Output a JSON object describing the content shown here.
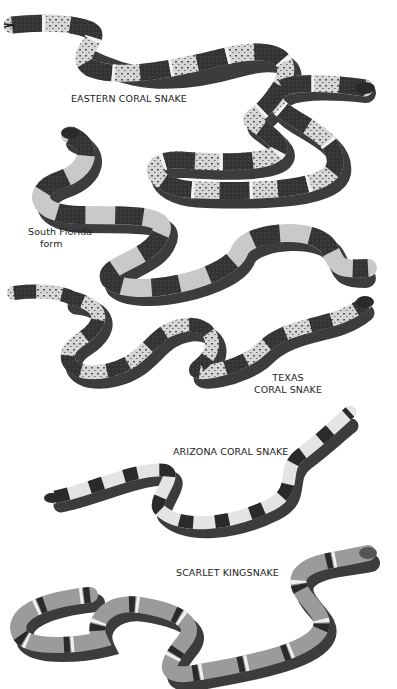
{
  "plate": {
    "colors": {
      "background": "#ffffff",
      "dark_band": "#2a2a2a",
      "mid_band": "#8a8a8a",
      "light_band": "#d8d8d8",
      "shadow": "#1a1a1a",
      "text": "#222222"
    },
    "labels": {
      "eastern": "EASTERN CORAL SNAKE",
      "south_florida_line1": "South Florida",
      "south_florida_line2": "form",
      "texas_line1": "TEXAS",
      "texas_line2": "CORAL SNAKE",
      "arizona": "ARIZONA CORAL SNAKE",
      "scarlet": "SCARLET KINGSNAKE"
    },
    "snakes": [
      {
        "name": "Eastern Coral Snake",
        "pattern": "speckled-wide-bands"
      },
      {
        "name": "Eastern Coral Snake (South Florida form)",
        "pattern": "plain-wide-bands"
      },
      {
        "name": "Texas Coral Snake",
        "pattern": "speckled-bands"
      },
      {
        "name": "Arizona Coral Snake",
        "pattern": "wide-light-bands"
      },
      {
        "name": "Scarlet Kingsnake",
        "pattern": "ringed-bands"
      }
    ]
  }
}
